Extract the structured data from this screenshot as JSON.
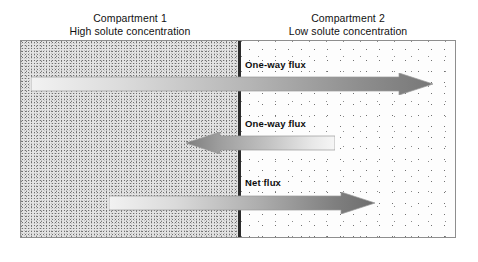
{
  "figure": {
    "headings": [
      {
        "id": "compartment-1",
        "line1": "Compartment 1",
        "line2": "High solute concentration"
      },
      {
        "id": "compartment-2",
        "line1": "Compartment 2",
        "line2": "Low solute concentration"
      }
    ],
    "membrane": {
      "name": "membrane-divider",
      "color": "#2b2b2b"
    },
    "compartments": [
      {
        "id": "compartment-1",
        "name": "high-concentration-region",
        "stipple_density": "dense",
        "fill": "#e4e4e4"
      },
      {
        "id": "compartment-2",
        "name": "low-concentration-region",
        "stipple_density": "sparse",
        "fill": "#fdfdfd"
      }
    ],
    "arrows": [
      {
        "id": "flux-top",
        "label": "One-way flux",
        "direction": "right",
        "from": "Compartment 1",
        "to": "Compartment 2",
        "gradient_from": "#eeeeee",
        "gradient_to": "#7b7b7b"
      },
      {
        "id": "flux-middle",
        "label": "One-way flux",
        "direction": "left",
        "from": "Compartment 2",
        "to": "Compartment 1",
        "gradient_from": "#f4f4f4",
        "gradient_to": "#8a8a8a"
      },
      {
        "id": "flux-net",
        "label": "Net flux",
        "direction": "right",
        "from": "Compartment 1",
        "to": "Compartment 2",
        "gradient_from": "#efefef",
        "gradient_to": "#6e6e6e"
      }
    ],
    "colors": {
      "border": "#8e8e8e",
      "text": "#111111",
      "label_text": "#0d0d0d",
      "background": "#ffffff"
    }
  }
}
